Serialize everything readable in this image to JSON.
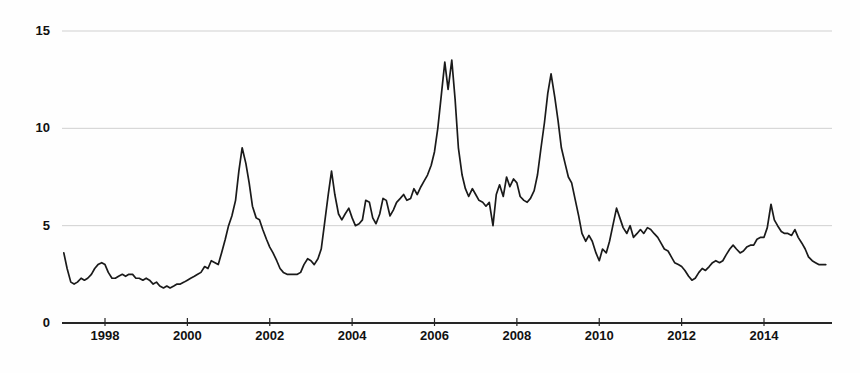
{
  "chart_data": {
    "type": "line",
    "title": "",
    "subtitle": "",
    "xlabel": "",
    "ylabel": "",
    "xlim": [
      1997.0,
      1997.0
    ],
    "ylim": [
      0,
      15
    ],
    "grid": true,
    "gridlines_y": [
      5,
      10,
      15
    ],
    "legend": null,
    "legend_position": "none",
    "annotations": [],
    "y_ticks": [
      {
        "value": 15,
        "label": "15"
      },
      {
        "value": 10,
        "label": "10"
      },
      {
        "value": 5,
        "label": "5"
      },
      {
        "value": 0,
        "label": "0"
      }
    ],
    "x_ticks": [
      {
        "value": 1998,
        "label": "1998"
      },
      {
        "value": 2000,
        "label": "2000"
      },
      {
        "value": 2002,
        "label": "2002"
      },
      {
        "value": 2004,
        "label": "2004"
      },
      {
        "value": 2006,
        "label": "2006"
      },
      {
        "value": 2008,
        "label": "2008"
      },
      {
        "value": 2010,
        "label": "2010"
      },
      {
        "value": 2012,
        "label": "2012"
      },
      {
        "value": 2014,
        "label": "2014"
      }
    ],
    "series": [
      {
        "name": "series-1",
        "color": "#1a1a1a",
        "line_width": 1.7,
        "x": [
          1997.0,
          1997.08,
          1997.17,
          1997.25,
          1997.33,
          1997.42,
          1997.5,
          1997.58,
          1997.67,
          1997.75,
          1997.83,
          1997.92,
          1998.0,
          1998.08,
          1998.17,
          1998.25,
          1998.33,
          1998.42,
          1998.5,
          1998.58,
          1998.67,
          1998.75,
          1998.83,
          1998.92,
          1999.0,
          1999.08,
          1999.17,
          1999.25,
          1999.33,
          1999.42,
          1999.5,
          1999.58,
          1999.67,
          1999.75,
          1999.83,
          1999.92,
          2000.0,
          2000.08,
          2000.17,
          2000.25,
          2000.33,
          2000.42,
          2000.5,
          2000.58,
          2000.67,
          2000.75,
          2000.83,
          2000.92,
          2001.0,
          2001.08,
          2001.17,
          2001.25,
          2001.33,
          2001.42,
          2001.5,
          2001.58,
          2001.67,
          2001.75,
          2001.83,
          2001.92,
          2002.0,
          2002.08,
          2002.17,
          2002.25,
          2002.33,
          2002.42,
          2002.5,
          2002.58,
          2002.67,
          2002.75,
          2002.83,
          2002.92,
          2003.0,
          2003.08,
          2003.17,
          2003.25,
          2003.33,
          2003.42,
          2003.5,
          2003.58,
          2003.67,
          2003.75,
          2003.83,
          2003.92,
          2004.0,
          2004.08,
          2004.17,
          2004.25,
          2004.33,
          2004.42,
          2004.5,
          2004.58,
          2004.67,
          2004.75,
          2004.83,
          2004.92,
          2005.0,
          2005.08,
          2005.17,
          2005.25,
          2005.33,
          2005.42,
          2005.5,
          2005.58,
          2005.67,
          2005.75,
          2005.83,
          2005.92,
          2006.0,
          2006.08,
          2006.17,
          2006.25,
          2006.33,
          2006.42,
          2006.5,
          2006.58,
          2006.67,
          2006.75,
          2006.83,
          2006.92,
          2007.0,
          2007.08,
          2007.17,
          2007.25,
          2007.33,
          2007.42,
          2007.5,
          2007.58,
          2007.67,
          2007.75,
          2007.83,
          2007.92,
          2008.0,
          2008.08,
          2008.17,
          2008.25,
          2008.33,
          2008.42,
          2008.5,
          2008.58,
          2008.67,
          2008.75,
          2008.83,
          2008.92,
          2009.0,
          2009.08,
          2009.17,
          2009.25,
          2009.33,
          2009.42,
          2009.5,
          2009.58,
          2009.67,
          2009.75,
          2009.83,
          2009.92,
          2010.0,
          2010.08,
          2010.17,
          2010.25,
          2010.33,
          2010.42,
          2010.5,
          2010.58,
          2010.67,
          2010.75,
          2010.83,
          2010.92,
          2011.0,
          2011.08,
          2011.17,
          2011.25,
          2011.33,
          2011.42,
          2011.5,
          2011.58,
          2011.67,
          2011.75,
          2011.83,
          2011.92,
          2012.0,
          2012.08,
          2012.17,
          2012.25,
          2012.33,
          2012.42,
          2012.5,
          2012.58,
          2012.67,
          2012.75,
          2012.83,
          2012.92,
          2013.0,
          2013.08,
          2013.17,
          2013.25,
          2013.33,
          2013.42,
          2013.5,
          2013.58,
          2013.67,
          2013.75,
          2013.83,
          2013.92,
          2014.0,
          2014.08,
          2014.17,
          2014.25,
          2014.33,
          2014.42,
          2014.5,
          2014.58,
          2014.67,
          2014.75,
          2014.83,
          2014.92,
          2015.0,
          2015.08,
          2015.17,
          2015.25,
          2015.33,
          2015.42,
          2015.5
        ],
        "values": [
          3.6,
          2.8,
          2.1,
          2.0,
          2.1,
          2.3,
          2.2,
          2.3,
          2.5,
          2.8,
          3.0,
          3.1,
          3.0,
          2.6,
          2.3,
          2.3,
          2.4,
          2.5,
          2.4,
          2.5,
          2.5,
          2.3,
          2.3,
          2.2,
          2.3,
          2.2,
          2.0,
          2.1,
          1.9,
          1.8,
          1.9,
          1.8,
          1.9,
          2.0,
          2.0,
          2.1,
          2.2,
          2.3,
          2.4,
          2.5,
          2.6,
          2.9,
          2.8,
          3.2,
          3.1,
          3.0,
          3.6,
          4.3,
          5.0,
          5.5,
          6.3,
          7.8,
          9.0,
          8.2,
          7.2,
          6.0,
          5.4,
          5.3,
          4.8,
          4.3,
          3.9,
          3.6,
          3.2,
          2.8,
          2.6,
          2.5,
          2.5,
          2.5,
          2.5,
          2.6,
          3.0,
          3.3,
          3.2,
          3.0,
          3.3,
          3.8,
          5.1,
          6.6,
          7.8,
          6.6,
          5.6,
          5.3,
          5.6,
          5.9,
          5.4,
          5.0,
          5.1,
          5.3,
          6.3,
          6.2,
          5.4,
          5.1,
          5.6,
          6.4,
          6.3,
          5.5,
          5.8,
          6.2,
          6.4,
          6.6,
          6.3,
          6.4,
          6.9,
          6.6,
          7.0,
          7.3,
          7.6,
          8.1,
          8.8,
          10.0,
          11.8,
          13.4,
          12.0,
          13.5,
          11.5,
          9.0,
          7.6,
          6.9,
          6.5,
          6.9,
          6.6,
          6.3,
          6.2,
          6.0,
          6.2,
          5.0,
          6.6,
          7.1,
          6.5,
          7.5,
          7.0,
          7.4,
          7.2,
          6.5,
          6.3,
          6.2,
          6.4,
          6.8,
          7.6,
          8.9,
          10.3,
          11.8,
          12.8,
          11.6,
          10.4,
          9.0,
          8.2,
          7.5,
          7.2,
          6.3,
          5.5,
          4.6,
          4.2,
          4.5,
          4.2,
          3.6,
          3.2,
          3.8,
          3.6,
          4.2,
          5.0,
          5.9,
          5.4,
          4.9,
          4.6,
          5.0,
          4.4,
          4.6,
          4.8,
          4.6,
          4.9,
          4.8,
          4.6,
          4.4,
          4.1,
          3.8,
          3.7,
          3.4,
          3.1,
          3.0,
          2.9,
          2.7,
          2.4,
          2.2,
          2.3,
          2.6,
          2.8,
          2.7,
          2.9,
          3.1,
          3.2,
          3.1,
          3.2,
          3.5,
          3.8,
          4.0,
          3.8,
          3.6,
          3.7,
          3.9,
          4.0,
          4.0,
          4.3,
          4.4,
          4.4,
          4.9,
          6.1,
          5.3,
          5.0,
          4.7,
          4.6,
          4.6,
          4.5,
          4.8,
          4.4,
          4.1,
          3.8,
          3.4,
          3.2,
          3.1,
          3.0,
          3.0,
          3.0
        ]
      }
    ]
  },
  "axes": {
    "y_axis_name": "value-axis",
    "x_axis_name": "year-axis",
    "axis_line_color": "#262626",
    "grid_color": "#d0d0d0",
    "background": "#ffffff"
  }
}
